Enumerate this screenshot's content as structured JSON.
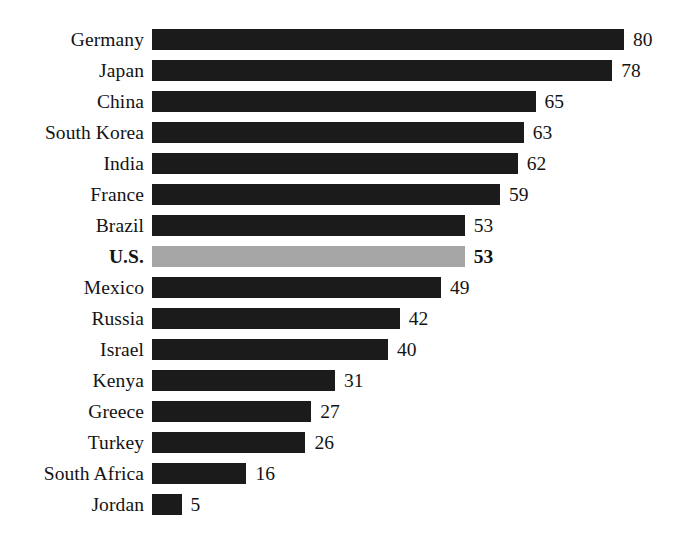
{
  "chart_data": {
    "type": "bar",
    "orientation": "horizontal",
    "title": "",
    "subtitle": "",
    "xlabel": "",
    "ylabel": "",
    "xlim": [
      0,
      80
    ],
    "grid": false,
    "legend": null,
    "bar_color": "#1b1b1b",
    "highlight_color": "#a6a6a6",
    "highlight_category": "U.S.",
    "categories": [
      "Germany",
      "Japan",
      "China",
      "South Korea",
      "India",
      "France",
      "Brazil",
      "U.S.",
      "Mexico",
      "Russia",
      "Israel",
      "Kenya",
      "Greece",
      "Turkey",
      "South Africa",
      "Jordan"
    ],
    "values": [
      80,
      78,
      65,
      63,
      62,
      59,
      53,
      53,
      49,
      42,
      40,
      31,
      27,
      26,
      16,
      5
    ]
  },
  "rows": [
    {
      "label": "Germany",
      "value": "80",
      "v": 80,
      "highlight": false
    },
    {
      "label": "Japan",
      "value": "78",
      "v": 78,
      "highlight": false
    },
    {
      "label": "China",
      "value": "65",
      "v": 65,
      "highlight": false
    },
    {
      "label": "South Korea",
      "value": "63",
      "v": 63,
      "highlight": false
    },
    {
      "label": "India",
      "value": "62",
      "v": 62,
      "highlight": false
    },
    {
      "label": "France",
      "value": "59",
      "v": 59,
      "highlight": false
    },
    {
      "label": "Brazil",
      "value": "53",
      "v": 53,
      "highlight": false
    },
    {
      "label": "U.S.",
      "value": "53",
      "v": 53,
      "highlight": true
    },
    {
      "label": "Mexico",
      "value": "49",
      "v": 49,
      "highlight": false
    },
    {
      "label": "Russia",
      "value": "42",
      "v": 42,
      "highlight": false
    },
    {
      "label": "Israel",
      "value": "40",
      "v": 40,
      "highlight": false
    },
    {
      "label": "Kenya",
      "value": "31",
      "v": 31,
      "highlight": false
    },
    {
      "label": "Greece",
      "value": "27",
      "v": 27,
      "highlight": false
    },
    {
      "label": "Turkey",
      "value": "26",
      "v": 26,
      "highlight": false
    },
    {
      "label": "South Africa",
      "value": "16",
      "v": 16,
      "highlight": false
    },
    {
      "label": "Jordan",
      "value": "5",
      "v": 5,
      "highlight": false
    }
  ],
  "colors": {
    "bar": "#1b1b1b",
    "highlight_bar": "#a6a6a6",
    "text": "#131313",
    "background": "#ffffff"
  }
}
